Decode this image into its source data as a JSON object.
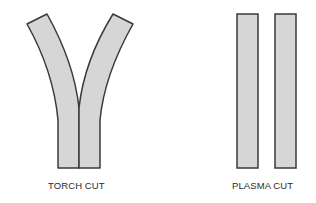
{
  "figures": [
    {
      "id": "torch",
      "label": "TORCH CUT",
      "shape": "curved kerf (Y-shaped, wide flared top)"
    },
    {
      "id": "plasma",
      "label": "PLASMA CUT",
      "shape": "straight parallel kerf"
    }
  ],
  "colors": {
    "fill": "#d6d6d6",
    "stroke": "#3a3a3a",
    "text": "#2a2a2a",
    "background": "#ffffff"
  }
}
